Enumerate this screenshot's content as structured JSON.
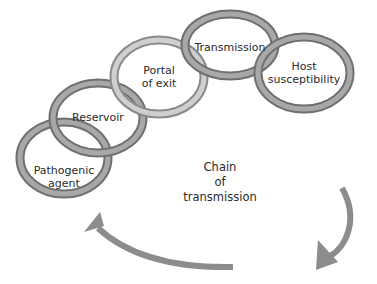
{
  "diagram": {
    "title": "Chain of transmission",
    "center_label": [
      "Chain",
      "of",
      "transmission"
    ],
    "links": [
      {
        "id": "pathogenic-agent",
        "lines": [
          "Pathogenic",
          "agent"
        ]
      },
      {
        "id": "reservoir",
        "lines": [
          "Reservoir"
        ]
      },
      {
        "id": "portal-of-exit",
        "lines": [
          "Portal",
          "of exit"
        ]
      },
      {
        "id": "transmission",
        "lines": [
          "Transmission"
        ]
      },
      {
        "id": "host-susceptibility",
        "lines": [
          "Host",
          "susceptibility"
        ]
      }
    ],
    "colors": {
      "ring_dark": "#7a7a7a",
      "ring_mid": "#a5a5a5",
      "ring_light": "#c8c8c8",
      "arrow": "#8c8c8c",
      "text": "#2a2a2a",
      "background": "#ffffff"
    }
  }
}
